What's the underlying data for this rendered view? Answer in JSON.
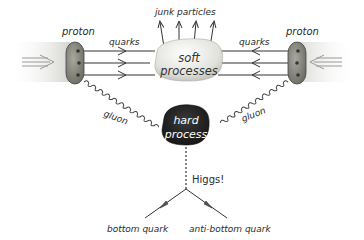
{
  "diagram": {
    "labels": {
      "proton_left": "proton",
      "proton_right": "proton",
      "quarks_left": "quarks",
      "quarks_right": "quarks",
      "junk": "junk particles",
      "soft_line1": "soft",
      "soft_line2": "processes",
      "hard_line1": "hard",
      "hard_line2": "process",
      "gluon_left": "gluon",
      "gluon_right": "gluon",
      "higgs": "Higgs!",
      "bottom": "bottom quark",
      "anti_bottom": "anti-bottom quark"
    },
    "colors": {
      "proton_fill": "#8a8a80",
      "soft_fill": "#e6e6e2",
      "hard_fill": "#1e1e1e",
      "line": "#333333",
      "beam": "#d8d8d8"
    }
  }
}
